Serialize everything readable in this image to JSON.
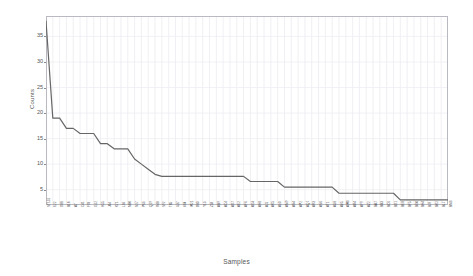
{
  "chart_data": {
    "type": "line",
    "title": "",
    "xlabel": "Samples",
    "ylabel": "Counts",
    "ylim": [
      2,
      39
    ],
    "yticks": [
      5,
      10,
      15,
      20,
      25,
      30,
      35
    ],
    "grid": true,
    "legend": false,
    "line_color": "#666666",
    "categories": [
      "ST131",
      "E22",
      "D88",
      "B18",
      "A7",
      "C41",
      "F93",
      "G12",
      "H55",
      "J04",
      "K71",
      "L36",
      "M80",
      "N27",
      "P63",
      "Q19",
      "R48",
      "S92",
      "T05",
      "U37",
      "V84",
      "W21",
      "X60",
      "Y13",
      "Z58",
      "AB9",
      "AC4",
      "AD7",
      "AE2",
      "AF6",
      "AG3",
      "AH8",
      "AJ1",
      "AK5",
      "AL0",
      "AM9",
      "AN4",
      "AP2",
      "AQ7",
      "AR3",
      "AS6",
      "AT1",
      "AU8",
      "AV5",
      "AW0",
      "AX4",
      "AY9",
      "AZ2",
      "BA7",
      "BB3",
      "BC6",
      "BD1",
      "BE8",
      "BF5",
      "BG0",
      "BH4",
      "BJ9",
      "BK2",
      "BL7",
      "BM3"
    ],
    "values": [
      38,
      19,
      19,
      17,
      17,
      16,
      16,
      16,
      14,
      14,
      13,
      13,
      13,
      11,
      10,
      9,
      8,
      7.6,
      7.6,
      7.6,
      7.6,
      7.6,
      7.6,
      7.6,
      7.6,
      7.6,
      7.6,
      7.6,
      7.6,
      7.6,
      6.6,
      6.6,
      6.6,
      6.6,
      6.6,
      5.5,
      5.5,
      5.5,
      5.5,
      5.5,
      5.5,
      5.5,
      5.5,
      4.3,
      4.3,
      4.3,
      4.3,
      4.3,
      4.3,
      4.3,
      4.3,
      4.3,
      3,
      3,
      3,
      3,
      3,
      3,
      3,
      3
    ]
  },
  "axis": {
    "y_title": "Counts",
    "x_title": "Samples"
  }
}
